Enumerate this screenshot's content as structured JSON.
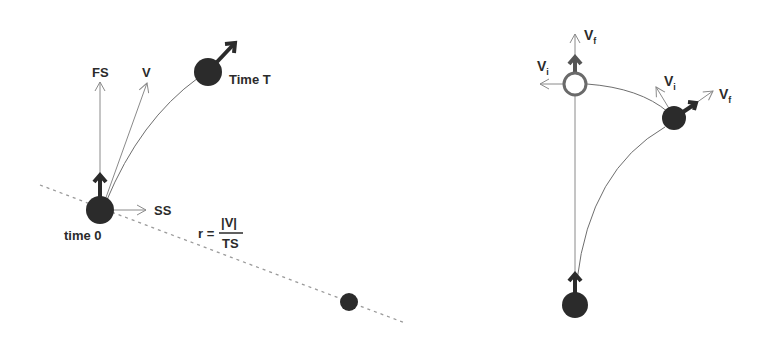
{
  "left_diagram": {
    "labels": {
      "forward_speed": "FS",
      "velocity": "V",
      "side_speed": "SS",
      "time_start": "time 0",
      "time_end": "Time T"
    },
    "formula": {
      "lhs": "r =",
      "numerator": "|V|",
      "denominator": "TS"
    }
  },
  "right_diagram": {
    "labels": {
      "top_vf": "V",
      "top_vf_sub": "f",
      "top_vi": "V",
      "top_vi_sub": "i",
      "mid_vi": "V",
      "mid_vi_sub": "i",
      "mid_vf": "V",
      "mid_vf_sub": "f"
    }
  },
  "colors": {
    "ball": "#2b2b2b",
    "hollow_ball_stroke": "#6a6a6a",
    "guide_line": "#8a8a8a"
  }
}
